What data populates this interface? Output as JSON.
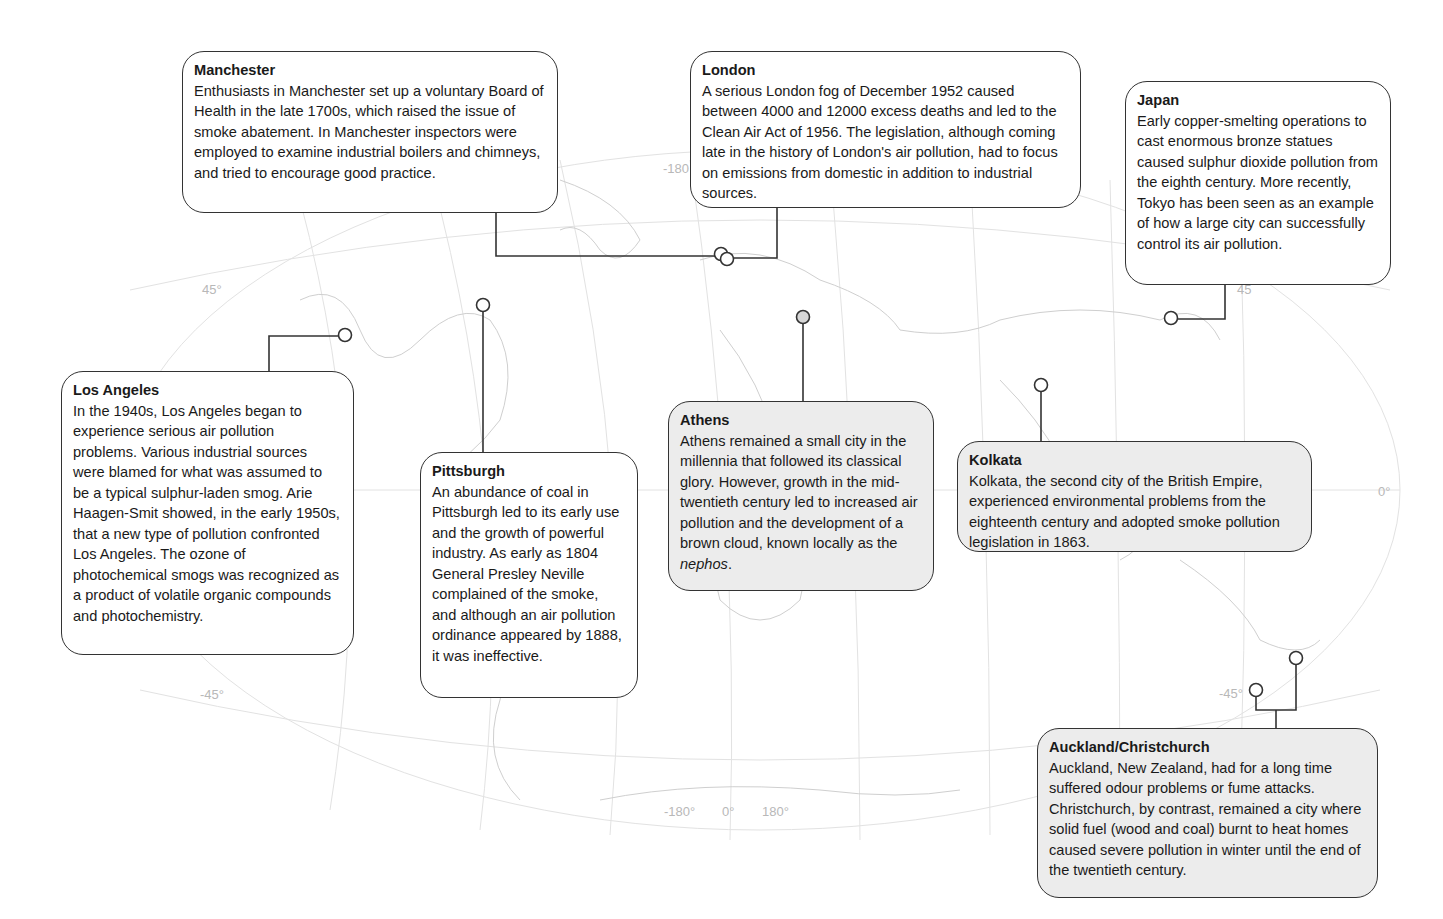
{
  "figure": {
    "type": "annotated world map",
    "projection_labels": {
      "lat_north": "45°",
      "lat_south": "-45°",
      "lat_equator": "0°",
      "lon_bottom": [
        "-180°",
        "0°",
        "180°"
      ],
      "lon_top": "-180",
      "japan_lat": "45",
      "nz_lat": "-45°"
    }
  },
  "callouts": [
    {
      "id": "manchester",
      "title": "Manchester",
      "body": "Enthusiasts in Manchester set up a voluntary Board of Health in the late 1700s, which raised the issue of smoke abatement. In Manchester inspectors were employed to examine industrial boilers and chimneys, and tried to encourage good practice.",
      "shaded": false
    },
    {
      "id": "london",
      "title": "London",
      "body": "A serious London fog of December 1952 caused between 4000 and 12000 excess deaths and led to the Clean Air Act of 1956. The legislation, although coming late in the history of London's air pollution, had to focus on emissions from domestic in addition to industrial sources.",
      "shaded": false
    },
    {
      "id": "japan",
      "title": "Japan",
      "body": "Early copper-smelting operations to cast enormous bronze statues caused sulphur dioxide pollution from the eighth century. More recently, Tokyo has been seen as an example of how a large city can successfully control its air pollution.",
      "shaded": false
    },
    {
      "id": "los-angeles",
      "title": "Los Angeles",
      "body": "In the 1940s, Los Angeles began to experience serious air pollution problems. Various industrial sources were blamed for what was assumed to be a typical sulphur-laden smog. Arie Haagen-Smit showed, in the early 1950s, that a new type of pollution confronted Los Angeles. The ozone of photochemical smogs was recognized as a product of volatile organic compounds and photochemistry.",
      "shaded": false
    },
    {
      "id": "pittsburgh",
      "title": "Pittsburgh",
      "body": "An abundance of coal in Pittsburgh led to its early use and the growth of powerful industry. As early as 1804 General Presley Neville complained of the smoke, and although an air pollution ordinance appeared by 1888, it was ineffective.",
      "shaded": false
    },
    {
      "id": "athens",
      "title": "Athens",
      "body": "Athens remained a small city in the millennia that followed its classical glory. However, growth in the mid-twentieth century led to increased air pollution and the development of a brown cloud, known locally as the",
      "body_italic": "nephos",
      "body_end": ".",
      "shaded": true
    },
    {
      "id": "kolkata",
      "title": "Kolkata",
      "body": "Kolkata, the second city of the British Empire, experienced environmental problems from the eighteenth century and adopted smoke pollution legislation in 1863.",
      "shaded": true
    },
    {
      "id": "auckland-christchurch",
      "title": "Auckland/Christchurch",
      "body": "Auckland, New Zealand, had for a long time suffered odour problems or fume attacks. Christchurch, by contrast, remained a city where solid fuel (wood and coal) burnt to heat homes caused severe pollution in winter until the end of the twentieth century.",
      "shaded": true
    }
  ],
  "colors": {
    "line": "#333333",
    "box_fill": "#ffffff",
    "box_fill_shaded": "#ececec",
    "map_lines": "#d4d4d4",
    "grid_labels": "#b8b8b8"
  }
}
